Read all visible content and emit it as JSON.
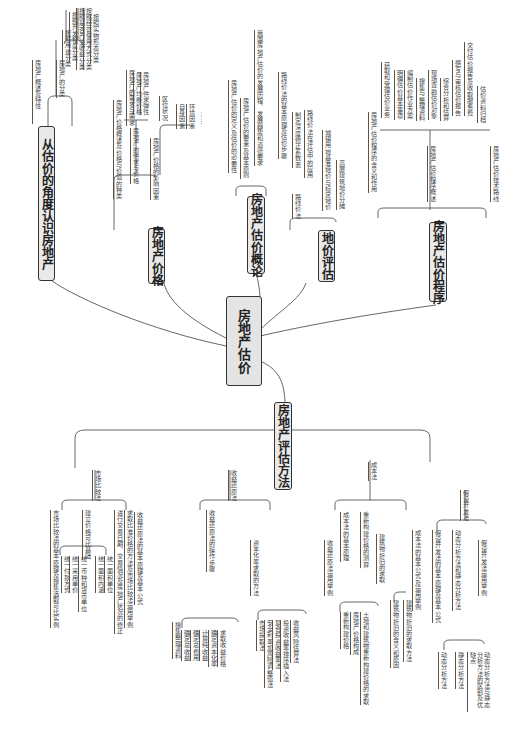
{
  "root": {
    "label": "房地产估价"
  },
  "branches": {
    "b1": {
      "label": "从估价的角度认识房地产",
      "children": [
        {
          "label": "房地产概述及特性"
        },
        {
          "label": "房地产的分类",
          "children": [
            "按照用途分类",
            "按照开发程度分类",
            "按照是否产生收益分类",
            "按照经营使用方式分类",
            "按照实物形态分类"
          ]
        }
      ]
    },
    "b2": {
      "label": "房地产价格",
      "children": [
        {
          "label": "房地产价格概述及价格与价值的种类"
        },
        {
          "label": "房地产的供求与价格",
          "children": [
            "房地产的需求与需求",
            "房地产均衡价格",
            "房地产供求弹性"
          ]
        },
        {
          "label": "房地产价格的影响因素",
          "children": [
            "区位状况",
            "自身因素",
            "环境因素",
            "……"
          ]
        }
      ]
    },
    "b3": {
      "label": "房地产估价概论",
      "children": [
        {
          "label": "房地产估价的定义及估价的必要性"
        },
        {
          "label": "房地产估价的要素及基本原则"
        },
        {
          "label": "我国房地产估价的发展历程、发展趋势和道德要求"
        }
      ]
    },
    "b4": {
      "label": "地价评估",
      "children": [
        {
          "label": "路线价法",
          "children": [
            "路线价法的基本原理及估价步骤",
            "制定深度修正系数表",
            "路线价法在评估中的应用"
          ]
        },
        {
          "label": "城镇用地基准地价与标定地价"
        },
        {
          "label": "高层建筑地价分摊"
        }
      ]
    },
    "b5": {
      "label": "房地产估价程序",
      "children": [
        {
          "label": "房地产估价程序的含义和作用"
        },
        {
          "label": "房地产估价程序概述",
          "children": [
            "获取和受理估价业务",
            "明确估价基本事项",
            "编制估价作业方案",
            "搜集与整理资料",
            "现场查勘估价对象",
            "综合分析和估算",
            "撰写与审核估价报告",
            "交付估价报告及收取服务费",
            "估价资料归档"
          ]
        },
        {
          "label": "房地产估价技术路线"
        }
      ]
    },
    "b6": {
      "label": "房地产评估方法",
      "children": [
        {
          "label": "市场比较法",
          "children": [
            {
              "label": "市场比较法的基本原理及搜集选取可比实例"
            },
            {
              "label": "建立价格可比基础",
              "children": [
                "统一付款方式",
                "统一采用单价",
                "统一币种和货币单位",
                "统一面积内涵",
                "统一面积单位"
              ]
            },
            {
              "label": "进行交易日期、交易情况及房地产状况的修正"
            },
            {
              "label": "求取比准价格的方法及市场比较法运用举例"
            }
          ]
        },
        {
          "label": "收益还原法",
          "children": [
            {
              "label": "收益还原法的基本原理及基本公式"
            },
            {
              "label": "收益还原法的操作步骤",
              "children": [
                "搜集整理资料",
                "确定总收益",
                "确定总费用",
                "计算纯收益",
                "确定资本化率",
                "求取收益价格"
              ]
            },
            {
              "label": "资本化率求取的方法",
              "children": [
                "市场提取法",
                "安全利率加风险调整值法",
                "复合投资收益率法",
                "投资收益率排序插入法",
                "收益风险估算法"
              ]
            },
            {
              "label": "收益还原法运用举例"
            }
          ]
        },
        {
          "label": "成本法",
          "children": [
            {
              "label": "成本法的基本原理"
            },
            {
              "label": "重新构建价格的测算",
              "children": [
                "重新构建价格",
                "房地产价格构成",
                "土地和建筑物重新构建价格的求取"
              ]
            },
            {
              "label": "建筑物折旧的求取",
              "children": [
                "建筑物折旧的含义和原因",
                "建筑物折旧的求取方法"
              ]
            },
            {
              "label": "成本法的基本公式及运用举例"
            }
          ]
        },
        {
          "label": "假设开发法",
          "children": [
            {
              "label": "假设开发法的基本原理及基本公式"
            },
            {
              "label": "动态分析方法和静态分析方法",
              "children": [
                "动态分析方法",
                "静态分析方法",
                "动态分析方法与静态分析方法的区别及优缺点"
              ]
            },
            {
              "label": "假设开发法运用举例"
            }
          ]
        }
      ]
    }
  }
}
